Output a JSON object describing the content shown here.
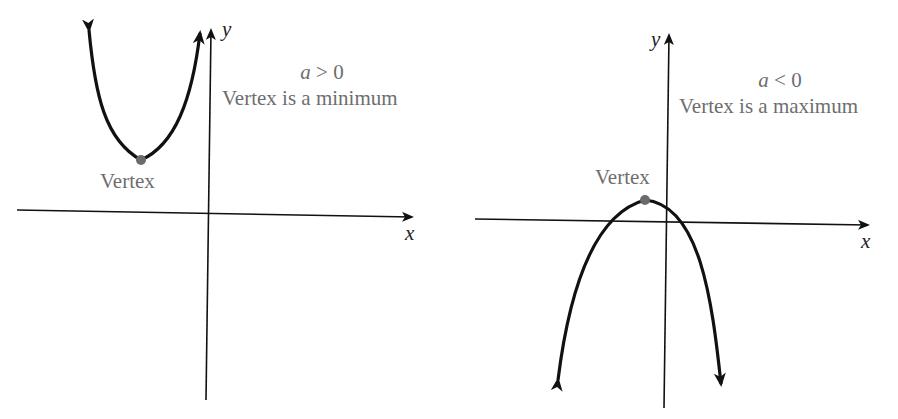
{
  "figure": {
    "panels": [
      {
        "id": "upward",
        "condition_var": "a",
        "condition_op": " > 0",
        "description": "Vertex is a minimum",
        "vertex_label": "Vertex",
        "x_axis_label": "x",
        "y_axis_label": "y",
        "opening": "up"
      },
      {
        "id": "downward",
        "condition_var": "a",
        "condition_op": " < 0",
        "description": "Vertex is a maximum",
        "vertex_label": "Vertex",
        "x_axis_label": "x",
        "y_axis_label": "y",
        "opening": "down"
      }
    ],
    "colors": {
      "curve": "#111111",
      "axis": "#111111",
      "vertex_dot": "#6b6b6b",
      "text": "#6e6e6e"
    }
  }
}
